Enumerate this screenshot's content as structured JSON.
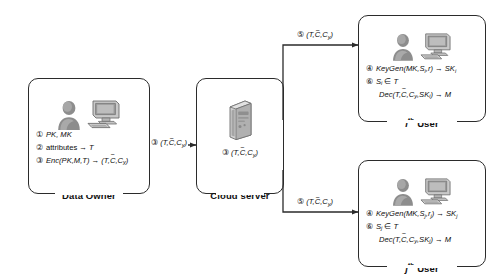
{
  "diagram": {
    "entities": [
      {
        "id": "data-owner",
        "caption_prefix": "",
        "caption_sup": "",
        "caption": "Data Owner",
        "icons": [
          "user-icon",
          "desktop-computer-icon"
        ],
        "steps": [
          {
            "num": "①",
            "text": "PK, MK",
            "italic": true,
            "indent": false
          },
          {
            "num": "②",
            "text": "attributes → T",
            "italic": false,
            "indent": false
          },
          {
            "num": "③",
            "text": "Enc(PK,M,T) → (T,C̄,Cᵧ)",
            "italic": true,
            "indent": false
          }
        ]
      },
      {
        "id": "cloud-server",
        "caption_prefix": "",
        "caption_sup": "",
        "caption": "Cloud server",
        "icons": [
          "server-tower-icon"
        ],
        "steps": [
          {
            "num": "③",
            "text": "(T,C̄,Cᵧ)",
            "italic": true,
            "indent": false
          }
        ]
      },
      {
        "id": "ith-user",
        "caption_prefix": "i",
        "caption_sup": "th",
        "caption": "User",
        "icons": [
          "user-icon",
          "desktop-computer-icon"
        ],
        "steps": [
          {
            "num": "④",
            "text": "KeyGen(MK,Sᵢ,r) → SKᵢ",
            "italic": true,
            "indent": false
          },
          {
            "num": "⑥",
            "text": "Sᵢ ∈ T",
            "italic": true,
            "indent": false
          },
          {
            "num": "",
            "text": "Dec(T,C̄,Cᵧ,SKᵢ) → M",
            "italic": true,
            "indent": true
          }
        ]
      },
      {
        "id": "jth-user",
        "caption_prefix": "j",
        "caption_sup": "th",
        "caption": "User",
        "icons": [
          "user-icon",
          "desktop-computer-icon"
        ],
        "steps": [
          {
            "num": "④",
            "text": "KeyGen(MK,Sⱼ,rⱼ) → SKⱼ",
            "italic": true,
            "indent": false
          },
          {
            "num": "⑥",
            "text": "Sⱼ ∈ T",
            "italic": true,
            "indent": false
          },
          {
            "num": "",
            "text": "Dec(T,C̄,Cᵧ,SKⱼ) → M",
            "italic": true,
            "indent": true
          }
        ]
      }
    ],
    "edges": [
      {
        "id": "owner-to-cloud",
        "label_num": "③",
        "label_body": "(T,C̄,Cᵧ)",
        "from": "data-owner",
        "to": "cloud-server"
      },
      {
        "id": "cloud-to-ith-user",
        "label_num": "⑤",
        "label_body": "(T,C̄,Cᵧ)",
        "from": "cloud-server",
        "to": "ith-user"
      },
      {
        "id": "cloud-to-jth-user",
        "label_num": "⑤",
        "label_body": "(T,C̄,Cᵧ)",
        "from": "cloud-server",
        "to": "jth-user"
      }
    ],
    "colors": {
      "stroke": "#2b2b2b",
      "text": "#0d0d0d",
      "background": "#ffffff",
      "icon_fill": "#9a9a9a",
      "icon_dark": "#6e6e6e"
    }
  }
}
